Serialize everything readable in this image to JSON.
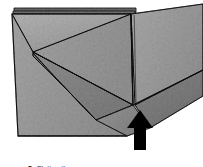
{
  "figure": {
    "name": "origami-fold-step-diagram",
    "step_number": "5.",
    "caption": "Flatten the open square",
    "full_caption": "5. Flatten the open square"
  },
  "colors": {
    "background": "#ffffff",
    "paper_light": "#d2d2d2",
    "paper_mid": "#c0c0c0",
    "paper_dark": "#b0b0b0",
    "paper_darker": "#a2a2a2",
    "paper_shadow": "#8f8f8f",
    "fold_line": "#2e2e2e",
    "edge_line": "#3a3a3a",
    "arrow": "#000000",
    "caption_text": "#2b2b2b"
  },
  "illustration": {
    "arrow": {
      "label": "flatten-direction-arrow",
      "direction": "up",
      "tip_x": 140,
      "tip_y": 110,
      "base_y": 150,
      "shaft_width": 12,
      "head_width": 26
    },
    "vertex_points": {
      "left_fold_vertex_x": 33,
      "left_fold_vertex_y": 52,
      "center_bottom_vertex_x": 133,
      "center_bottom_vertex_y": 105,
      "center_top_x": 131,
      "center_top_y": 14
    },
    "panels": [
      {
        "name": "left-panel",
        "shade": "#c6c6c6"
      },
      {
        "name": "upper-triangle-flap",
        "shade": "#cfcfcf"
      },
      {
        "name": "lower-triangle-flap",
        "shade": "#b9b9b9"
      },
      {
        "name": "right-panel-upper",
        "shade": "#c9c9c9"
      },
      {
        "name": "right-panel-lower",
        "shade": "#b4b4b4"
      },
      {
        "name": "top-layer-edge",
        "shade": "#9a9a9a"
      }
    ]
  }
}
